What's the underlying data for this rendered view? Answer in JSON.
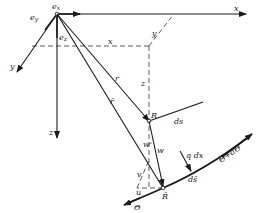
{
  "diagram": {
    "labels": {
      "e_x": "e",
      "e_x_sub": "x",
      "e_y": "e",
      "e_y_sub": "y",
      "e_z": "e",
      "e_z_sub": "z",
      "axis_x": "x",
      "axis_y": "y",
      "axis_z": "z",
      "coord_x": "x",
      "coord_y": "y",
      "coord_z": "z",
      "r": "r",
      "r_bar": "r̄",
      "R": "R",
      "R_bar": "R̄",
      "ds": "ds",
      "ds_bar": "ds̄",
      "w": "w",
      "w_prime": "w'",
      "v": "v",
      "u": "u",
      "theta": "Θ",
      "theta_plus": "Θ+dΘ",
      "q_dx": "q dx"
    },
    "colors": {
      "ink": "#1a1a1a",
      "background": "#ffffff"
    }
  }
}
